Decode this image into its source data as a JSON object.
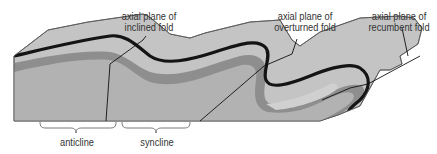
{
  "labels": {
    "inclined": {
      "line1": "axial plane of",
      "line2": "inclined fold"
    },
    "overturned": {
      "line1": "axial plane of",
      "line2": "overturned fold"
    },
    "recumbent": {
      "line1": "axial plane of",
      "line2": "recumbent fold"
    },
    "anticline": "anticline",
    "syncline": "syncline"
  },
  "colors": {
    "surface": "#c4c4c4",
    "outline": "#555555",
    "marker_layer": "#1a1a1a",
    "dark_layer": "#8a8a8a",
    "mid_layer": "#b0b0b0",
    "light_layer": "#c8c8c8",
    "text": "#333333"
  }
}
